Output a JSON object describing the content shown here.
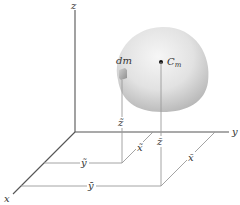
{
  "diagram": {
    "axes": {
      "x_label": "x",
      "y_label": "y",
      "z_label": "z"
    },
    "body": {
      "element_label": "dm",
      "center_of_mass_label_main": "C",
      "center_of_mass_label_sub": "m"
    },
    "dimensions": {
      "dm_x": "x̃",
      "dm_y": "ỹ",
      "dm_z": "z̃",
      "cm_x": "x̄",
      "cm_y": "ȳ",
      "cm_z": "z̄"
    },
    "colors": {
      "axis": "#555555",
      "guide": "#9a9a9a",
      "body_light": "#f4f4f4",
      "body_dark": "#b8b8b8",
      "text": "#333333"
    }
  }
}
